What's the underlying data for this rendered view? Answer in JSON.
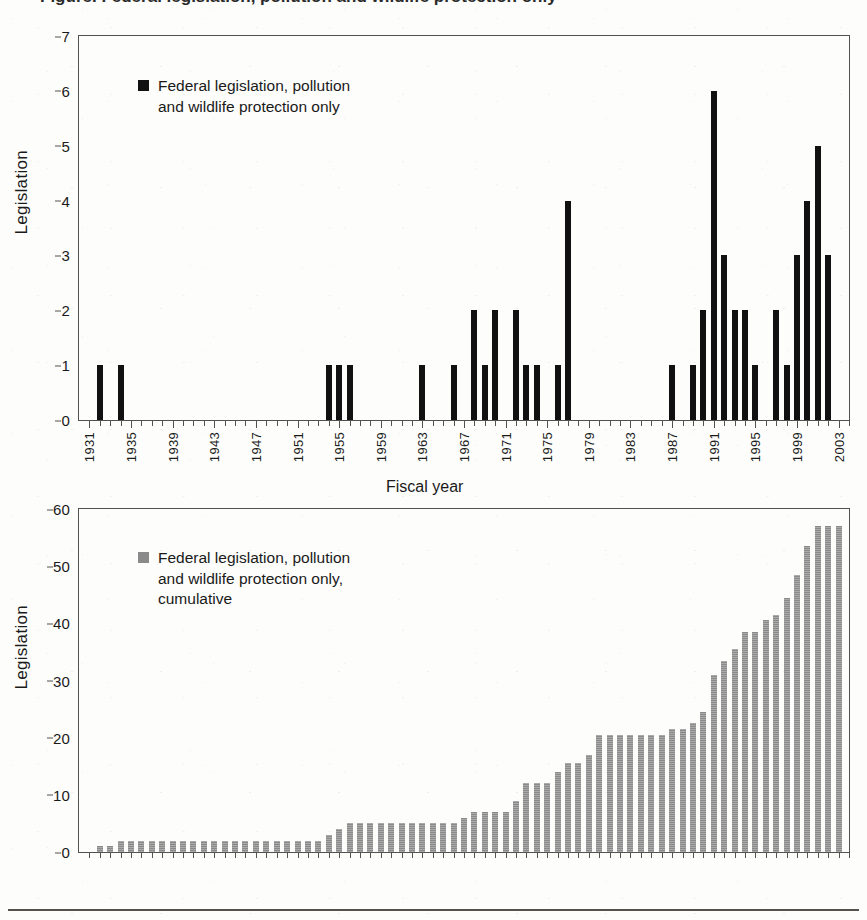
{
  "figure": {
    "title_partial": "Figure. Federal legislation, pollution and wildlife protection only",
    "background_color": "#fdfdfb",
    "frame_color": "#55524e"
  },
  "panels": [
    {
      "id": "annual",
      "ylabel": "Legislation",
      "xlabel": "",
      "legend": {
        "swatch_color": "#111111",
        "text": "Federal legislation, pollution\nand wildlife protection only"
      }
    },
    {
      "id": "cumulative",
      "ylabel": "Legislation",
      "xlabel": "Fiscal year",
      "legend": {
        "swatch_color": "#8a8a8a",
        "text": "Federal legislation, pollution\nand wildlife protection only,\ncumulative"
      }
    }
  ],
  "chart_data": [
    {
      "type": "bar",
      "id": "annual",
      "title": "",
      "xlabel": "",
      "ylabel": "Legislation",
      "ylim": [
        0,
        7
      ],
      "yticks": [
        0,
        1,
        2,
        3,
        4,
        5,
        6,
        7
      ],
      "ytick_labels": [
        "0",
        "1",
        "2",
        "3",
        "4",
        "5",
        "6",
        "7"
      ],
      "xlim": [
        1930,
        2004
      ],
      "xticks": [
        1931,
        1935,
        1939,
        1943,
        1947,
        1951,
        1955,
        1959,
        1963,
        1967,
        1971,
        1975,
        1979,
        1983,
        1987,
        1991,
        1995,
        1999,
        2003
      ],
      "xtick_labels": [
        "1931",
        "1935",
        "1939",
        "1943",
        "1947",
        "1951",
        "1955",
        "1959",
        "1963",
        "1967",
        "1971",
        "1975",
        "1979",
        "1983",
        "1987",
        "1991",
        "1995",
        "1999",
        "2003"
      ],
      "grid": false,
      "legend_position": "upper-left",
      "bar_color": "#111111",
      "series": [
        {
          "name": "Federal legislation, pollution and wildlife protection only",
          "categories": [
            1931,
            1932,
            1933,
            1934,
            1935,
            1936,
            1937,
            1938,
            1939,
            1940,
            1941,
            1942,
            1943,
            1944,
            1945,
            1946,
            1947,
            1948,
            1949,
            1950,
            1951,
            1952,
            1953,
            1954,
            1955,
            1956,
            1957,
            1958,
            1959,
            1960,
            1961,
            1962,
            1963,
            1964,
            1965,
            1966,
            1967,
            1968,
            1969,
            1970,
            1971,
            1972,
            1973,
            1974,
            1975,
            1976,
            1977,
            1978,
            1979,
            1980,
            1981,
            1982,
            1983,
            1984,
            1985,
            1986,
            1987,
            1988,
            1989,
            1990,
            1991,
            1992,
            1993,
            1994,
            1995,
            1996,
            1997,
            1998,
            1999,
            2000,
            2001,
            2002,
            2003
          ],
          "values": [
            0,
            1,
            0,
            1,
            0,
            0,
            0,
            0,
            0,
            0,
            0,
            0,
            0,
            0,
            0,
            0,
            0,
            0,
            0,
            0,
            0,
            0,
            0,
            1,
            1,
            1,
            0,
            0,
            0,
            0,
            0,
            0,
            1,
            0,
            0,
            1,
            0,
            2,
            1,
            2,
            0,
            2,
            1,
            1,
            0,
            1,
            4,
            0,
            0,
            0,
            0,
            0,
            0,
            0,
            0,
            0,
            1,
            0,
            1,
            2,
            6,
            3,
            2,
            2,
            1,
            0,
            2,
            1,
            3,
            4,
            5,
            3,
            0
          ]
        }
      ]
    },
    {
      "type": "bar",
      "id": "cumulative",
      "title": "",
      "xlabel": "Fiscal year",
      "ylabel": "Legislation",
      "ylim": [
        0,
        60
      ],
      "yticks": [
        0,
        10,
        20,
        30,
        40,
        50,
        60
      ],
      "ytick_labels": [
        "0",
        "10",
        "20",
        "30",
        "40",
        "50",
        "60"
      ],
      "xlim": [
        1930,
        2004
      ],
      "grid": false,
      "legend_position": "upper-left",
      "bar_color": "#8a8a8a",
      "series": [
        {
          "name": "Federal legislation, pollution and wildlife protection only, cumulative",
          "categories": [
            1931,
            1932,
            1933,
            1934,
            1935,
            1936,
            1937,
            1938,
            1939,
            1940,
            1941,
            1942,
            1943,
            1944,
            1945,
            1946,
            1947,
            1948,
            1949,
            1950,
            1951,
            1952,
            1953,
            1954,
            1955,
            1956,
            1957,
            1958,
            1959,
            1960,
            1961,
            1962,
            1963,
            1964,
            1965,
            1966,
            1967,
            1968,
            1969,
            1970,
            1971,
            1972,
            1973,
            1974,
            1975,
            1976,
            1977,
            1978,
            1979,
            1980,
            1981,
            1982,
            1983,
            1984,
            1985,
            1986,
            1987,
            1988,
            1989,
            1990,
            1991,
            1992,
            1993,
            1994,
            1995,
            1996,
            1997,
            1998,
            1999,
            2000,
            2001,
            2002,
            2003
          ],
          "values": [
            0,
            1,
            1,
            2,
            2,
            2,
            2,
            2,
            2,
            2,
            2,
            2,
            2,
            2,
            2,
            2,
            2,
            2,
            2,
            2,
            2,
            2,
            2,
            3,
            4,
            5,
            5,
            5,
            5,
            5,
            5,
            5,
            5,
            5,
            5,
            5,
            6,
            7,
            7,
            7,
            7,
            9,
            12,
            12,
            12,
            14,
            15.5,
            15.5,
            17,
            20.5,
            20.5,
            20.5,
            20.5,
            20.5,
            20.5,
            20.5,
            21.5,
            21.5,
            22.5,
            24.5,
            31,
            33.5,
            35.5,
            38.5,
            38.5,
            40.5,
            41.5,
            44.5,
            48.5,
            53.5,
            57,
            57,
            57
          ]
        }
      ]
    }
  ]
}
